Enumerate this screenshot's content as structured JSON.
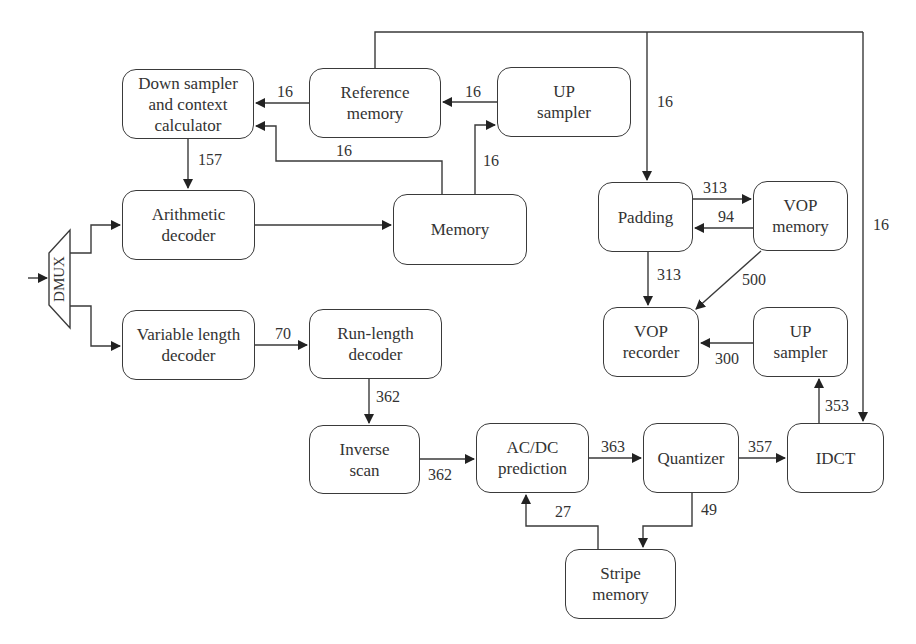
{
  "diagram": {
    "type": "block-diagram",
    "nodes": {
      "down_sampler": {
        "label": "Down sampler\nand context\ncalculator"
      },
      "reference_memory": {
        "label": "Reference\nmemory"
      },
      "up_sampler_top": {
        "label": "UP\nsampler"
      },
      "arithmetic_decoder": {
        "label": "Arithmetic\ndecoder"
      },
      "memory": {
        "label": "Memory"
      },
      "padding": {
        "label": "Padding"
      },
      "vop_memory": {
        "label": "VOP\nmemory"
      },
      "dmux": {
        "label": "DMUX"
      },
      "variable_length_decoder": {
        "label": "Variable length\ndecoder"
      },
      "run_length_decoder": {
        "label": "Run-length\ndecoder"
      },
      "vop_recorder": {
        "label": "VOP\nrecorder"
      },
      "up_sampler_right": {
        "label": "UP\nsampler"
      },
      "inverse_scan": {
        "label": "Inverse\nscan"
      },
      "acdc_prediction": {
        "label": "AC/DC\nprediction"
      },
      "quantizer": {
        "label": "Quantizer"
      },
      "idct": {
        "label": "IDCT"
      },
      "stripe_memory": {
        "label": "Stripe\nmemory"
      }
    },
    "edges": [
      {
        "from": "reference_memory",
        "to": "down_sampler",
        "label": "16"
      },
      {
        "from": "up_sampler_top",
        "to": "reference_memory",
        "label": "16"
      },
      {
        "from": "memory",
        "to": "down_sampler",
        "label": "16"
      },
      {
        "from": "memory",
        "to": "up_sampler_top",
        "label": "16"
      },
      {
        "from": "down_sampler",
        "to": "arithmetic_decoder",
        "label": "157"
      },
      {
        "from": "arithmetic_decoder",
        "to": "memory",
        "label": ""
      },
      {
        "from": "reference_memory",
        "to": "padding",
        "label": "16"
      },
      {
        "from": "reference_memory",
        "to": "idct",
        "label": "16"
      },
      {
        "from": "padding",
        "to": "vop_memory",
        "label": "313"
      },
      {
        "from": "vop_memory",
        "to": "padding",
        "label": "94"
      },
      {
        "from": "padding",
        "to": "vop_recorder",
        "label": "313"
      },
      {
        "from": "vop_memory",
        "to": "vop_recorder",
        "label": "500"
      },
      {
        "from": "dmux",
        "to": "arithmetic_decoder",
        "label": ""
      },
      {
        "from": "dmux",
        "to": "variable_length_decoder",
        "label": ""
      },
      {
        "from": "variable_length_decoder",
        "to": "run_length_decoder",
        "label": "70"
      },
      {
        "from": "up_sampler_right",
        "to": "vop_recorder",
        "label": "300"
      },
      {
        "from": "run_length_decoder",
        "to": "inverse_scan",
        "label": "362"
      },
      {
        "from": "inverse_scan",
        "to": "acdc_prediction",
        "label": "362"
      },
      {
        "from": "acdc_prediction",
        "to": "quantizer",
        "label": "363"
      },
      {
        "from": "quantizer",
        "to": "idct",
        "label": "357"
      },
      {
        "from": "idct",
        "to": "up_sampler_right",
        "label": "353"
      },
      {
        "from": "quantizer",
        "to": "stripe_memory",
        "label": "49"
      },
      {
        "from": "stripe_memory",
        "to": "acdc_prediction",
        "label": "27"
      }
    ],
    "edge_labels": {
      "ref_to_down": "16",
      "up_to_ref": "16",
      "mem_to_down": "16",
      "mem_to_up": "16",
      "down_to_arith": "157",
      "top_to_padding": "16",
      "top_to_idct": "16",
      "pad_to_vopmem": "313",
      "vopmem_to_pad": "94",
      "pad_to_recorder": "313",
      "vopmem_to_recorder": "500",
      "vld_to_rld": "70",
      "upr_to_recorder": "300",
      "rld_to_iscan": "362",
      "iscan_to_acdc": "362",
      "acdc_to_quant": "363",
      "quant_to_idct": "357",
      "idct_to_upr": "353",
      "quant_to_stripe": "49",
      "stripe_to_acdc": "27"
    },
    "colors": {
      "stroke": "#3a3a3a",
      "text": "#333333",
      "background": "#ffffff"
    }
  }
}
